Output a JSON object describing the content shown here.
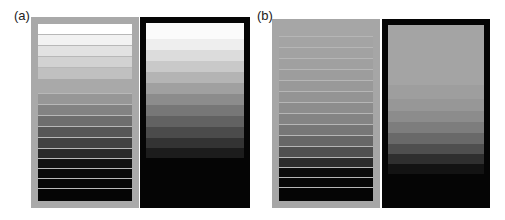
{
  "figure": {
    "panels": [
      {
        "label": "(a)",
        "label_pos": [
          14,
          8
        ],
        "stripe_box": {
          "rect": [
            31,
            17,
            108,
            191
          ],
          "frame_color": "#a9a9a9",
          "inner": [
            7,
            7,
            94,
            177
          ],
          "separator_color": "#b8b8b8",
          "stripes": [
            {
              "y": 0,
              "h": 10,
              "color": "#ffffff"
            },
            {
              "y": 11,
              "h": 10,
              "color": "#f2f2f2"
            },
            {
              "y": 22,
              "h": 10,
              "color": "#e2e2e2"
            },
            {
              "y": 33,
              "h": 10,
              "color": "#d2d2d2"
            },
            {
              "y": 44,
              "h": 11,
              "color": "#c0c0c0"
            },
            {
              "y": 55,
              "h": 14,
              "color": "#a9a9a9"
            },
            {
              "y": 70,
              "h": 10,
              "color": "#979797"
            },
            {
              "y": 81,
              "h": 10,
              "color": "#838383"
            },
            {
              "y": 92,
              "h": 10,
              "color": "#6e6e6e"
            },
            {
              "y": 103,
              "h": 10,
              "color": "#575757"
            },
            {
              "y": 114,
              "h": 10,
              "color": "#424242"
            },
            {
              "y": 125,
              "h": 9,
              "color": "#2a2a2a"
            },
            {
              "y": 135,
              "h": 9,
              "color": "#121212"
            },
            {
              "y": 145,
              "h": 9,
              "color": "#0a0a0a"
            },
            {
              "y": 155,
              "h": 9,
              "color": "#070707"
            },
            {
              "y": 165,
              "h": 12,
              "color": "#050505"
            }
          ]
        },
        "gradient_box": {
          "rect": [
            140,
            17,
            110,
            191
          ],
          "frame_color": "#050505",
          "inner": [
            6,
            6,
            98,
            179
          ],
          "steps": [
            {
              "y": 0,
              "h": 16,
              "color": "#fbfbfb"
            },
            {
              "y": 16,
              "h": 11,
              "color": "#eeeeee"
            },
            {
              "y": 27,
              "h": 11,
              "color": "#dcdcdc"
            },
            {
              "y": 38,
              "h": 11,
              "color": "#c9c9c9"
            },
            {
              "y": 49,
              "h": 11,
              "color": "#b4b4b4"
            },
            {
              "y": 60,
              "h": 11,
              "color": "#a0a0a0"
            },
            {
              "y": 71,
              "h": 11,
              "color": "#8c8c8c"
            },
            {
              "y": 82,
              "h": 11,
              "color": "#777777"
            },
            {
              "y": 93,
              "h": 11,
              "color": "#626262"
            },
            {
              "y": 104,
              "h": 11,
              "color": "#4b4b4b"
            },
            {
              "y": 115,
              "h": 10,
              "color": "#333333"
            },
            {
              "y": 125,
              "h": 10,
              "color": "#1c1c1c"
            },
            {
              "y": 135,
              "h": 44,
              "color": "#050505"
            }
          ]
        }
      },
      {
        "label": "(b)",
        "label_pos": [
          257,
          8
        ],
        "stripe_box": {
          "rect": [
            272,
            19,
            108,
            189
          ],
          "frame_color": "#a6a6a6",
          "inner": [
            7,
            7,
            94,
            175
          ],
          "separator_color": "#b6b6b6",
          "stripes": [
            {
              "y": 0,
              "h": 10,
              "color": "#a6a6a6"
            },
            {
              "y": 11,
              "h": 10,
              "color": "#a4a4a4"
            },
            {
              "y": 22,
              "h": 10,
              "color": "#a2a2a2"
            },
            {
              "y": 33,
              "h": 10,
              "color": "#a0a0a0"
            },
            {
              "y": 44,
              "h": 10,
              "color": "#9d9d9d"
            },
            {
              "y": 55,
              "h": 10,
              "color": "#999999"
            },
            {
              "y": 66,
              "h": 10,
              "color": "#949494"
            },
            {
              "y": 77,
              "h": 10,
              "color": "#8d8d8d"
            },
            {
              "y": 88,
              "h": 10,
              "color": "#848484"
            },
            {
              "y": 99,
              "h": 10,
              "color": "#777777"
            },
            {
              "y": 110,
              "h": 10,
              "color": "#676767"
            },
            {
              "y": 121,
              "h": 10,
              "color": "#505050"
            },
            {
              "y": 132,
              "h": 9,
              "color": "#2c2c2c"
            },
            {
              "y": 142,
              "h": 9,
              "color": "#0c0c0c"
            },
            {
              "y": 152,
              "h": 9,
              "color": "#070707"
            },
            {
              "y": 162,
              "h": 13,
              "color": "#050505"
            }
          ]
        },
        "gradient_box": {
          "rect": [
            382,
            19,
            108,
            189
          ],
          "frame_color": "#050505",
          "inner": [
            6,
            6,
            96,
            177
          ],
          "steps": [
            {
              "y": 0,
              "h": 60,
              "color": "#a4a4a4"
            },
            {
              "y": 60,
              "h": 14,
              "color": "#9e9e9e"
            },
            {
              "y": 74,
              "h": 12,
              "color": "#979797"
            },
            {
              "y": 86,
              "h": 11,
              "color": "#8c8c8c"
            },
            {
              "y": 97,
              "h": 11,
              "color": "#7d7d7d"
            },
            {
              "y": 108,
              "h": 11,
              "color": "#696969"
            },
            {
              "y": 119,
              "h": 10,
              "color": "#4f4f4f"
            },
            {
              "y": 129,
              "h": 10,
              "color": "#2f2f2f"
            },
            {
              "y": 139,
              "h": 10,
              "color": "#131313"
            },
            {
              "y": 149,
              "h": 28,
              "color": "#050505"
            }
          ]
        }
      }
    ]
  }
}
